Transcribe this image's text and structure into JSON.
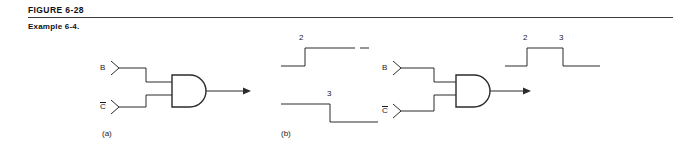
{
  "figure": {
    "number_label": "FIGURE 6-28",
    "caption": "Example 6-4."
  },
  "parts": {
    "a": {
      "label": "(a)",
      "inputs": [
        {
          "name": "B",
          "overbar": false,
          "text": "B"
        },
        {
          "name": "C-not",
          "overbar": true,
          "text": "C"
        }
      ],
      "gate": "AND"
    },
    "b": {
      "label": "(b)",
      "inputs": [
        {
          "name": "B",
          "overbar": false,
          "text": "B"
        },
        {
          "name": "C-not",
          "overbar": true,
          "text": "C"
        }
      ],
      "gate": "AND",
      "input_waveforms": [
        {
          "signal": "B",
          "edge_label": "2",
          "transition": "low-to-high"
        },
        {
          "signal": "C-not",
          "edge_label": "3",
          "transition": "high-to-low"
        }
      ],
      "output_waveform": {
        "rise_label": "2",
        "fall_label": "3",
        "shape": "pulse-high-between-2-and-3"
      }
    }
  },
  "colors": {
    "ink": "#2b2b2b",
    "text": "#1a1a1a",
    "rule": "#3a3a3a",
    "background": "#ffffff"
  }
}
